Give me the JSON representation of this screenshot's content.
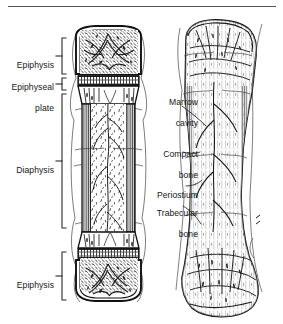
{
  "figure": {
    "type": "anatomical-line-drawing",
    "style": "black-and-white engraved scan",
    "views": [
      {
        "name": "longitudinal-section-view",
        "side": "left"
      },
      {
        "name": "whole-bone-surface-view",
        "side": "right"
      }
    ],
    "top_rule": true
  },
  "labels": {
    "left": [
      {
        "name": "epiphysis-top",
        "text": "Epiphysis",
        "lines": [
          "Epiphysis"
        ]
      },
      {
        "name": "epiphyseal-plate",
        "text": "Epiphyseal plate",
        "lines": [
          "Epiphyseal",
          "plate"
        ]
      },
      {
        "name": "diaphysis",
        "text": "Diaphysis",
        "lines": [
          "Diaphysis"
        ]
      },
      {
        "name": "epiphysis-bottom",
        "text": "Epiphysis",
        "lines": [
          "Epiphysis"
        ]
      }
    ],
    "right": [
      {
        "name": "marrow-cavity",
        "text": "Marrow cavity",
        "lines": [
          "Marrow",
          "cavity"
        ]
      },
      {
        "name": "compact-bone",
        "text": "Compact bone",
        "lines": [
          "Compact",
          "bone"
        ]
      },
      {
        "name": "periostium",
        "text": "Periostium",
        "lines": [
          "Periostium"
        ]
      },
      {
        "name": "trabecular-bone",
        "text": "Trabecular bone",
        "lines": [
          "Trabecular",
          "bone"
        ]
      }
    ]
  },
  "colors": {
    "ink": "#1a1a1a",
    "paper": "#ffffff",
    "shade": "#6a6a6a",
    "light": "#9a9a9a"
  }
}
